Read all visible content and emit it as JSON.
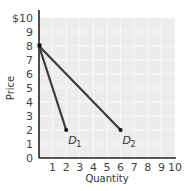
{
  "chart_data": {
    "type": "line",
    "title": "",
    "xlabel": "Quantity",
    "ylabel": "Price",
    "xlim": [
      0,
      10
    ],
    "ylim": [
      0,
      10
    ],
    "x_ticks": [
      "1",
      "2",
      "3",
      "4",
      "5",
      "6",
      "7",
      "8",
      "9",
      "10"
    ],
    "y_ticks": [
      "0",
      "1",
      "2",
      "3",
      "4",
      "5",
      "6",
      "7",
      "8",
      "9",
      "$10"
    ],
    "grid": true,
    "series": [
      {
        "name": "D1",
        "label": "D",
        "subscript": "1",
        "points": [
          [
            0,
            8
          ],
          [
            2,
            2
          ]
        ]
      },
      {
        "name": "D2",
        "label": "D",
        "subscript": "2",
        "points": [
          [
            0,
            8
          ],
          [
            6,
            2
          ]
        ]
      }
    ],
    "colors": {
      "line": "#3a3a3a",
      "axis": "#222222",
      "plot_bg": "#ececef",
      "grid": "#f7f7f9"
    }
  }
}
